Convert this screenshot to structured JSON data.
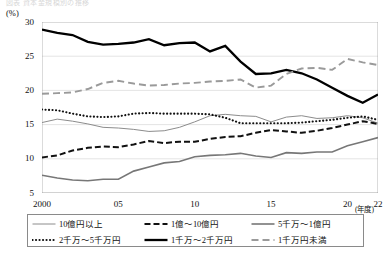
{
  "top_partial_text": "図表 資本金規模別の推移",
  "axis": {
    "unit_label": "(%)",
    "y_ticks": [
      "30",
      "25",
      "20",
      "15",
      "10",
      "5"
    ],
    "y_min": 5,
    "y_max": 30,
    "x_ticks": [
      {
        "label": "2000",
        "year": 2000
      },
      {
        "label": "05",
        "year": 2005
      },
      {
        "label": "10",
        "year": 2010
      },
      {
        "label": "15",
        "year": 2015
      },
      {
        "label": "20",
        "year": 2020
      },
      {
        "label": "22",
        "year": 2022
      }
    ],
    "x_unit_label": "(年度)"
  },
  "legend": {
    "items": [
      {
        "label": "10億円以上",
        "style": "thin-gray-solid",
        "color": "#8c8c8c"
      },
      {
        "label": "1億～10億円",
        "style": "black-dashed",
        "color": "#111111"
      },
      {
        "label": "5千万～1億円",
        "style": "gray-solid",
        "color": "#777777"
      },
      {
        "label": "2千万～5千万円",
        "style": "black-dotted",
        "color": "#111111"
      },
      {
        "label": "1千万～2千万円",
        "style": "thick-black-solid",
        "color": "#000000"
      },
      {
        "label": "1千万円未満",
        "style": "gray-dashed",
        "color": "#9a9a9a"
      }
    ]
  },
  "chart_data": {
    "type": "line",
    "title": "",
    "xlabel": "(年度)",
    "ylabel": "(%)",
    "ylim": [
      5,
      30
    ],
    "xlim": [
      2000,
      2022
    ],
    "grid": true,
    "legend_position": "bottom",
    "x": [
      2000,
      2001,
      2002,
      2003,
      2004,
      2005,
      2006,
      2007,
      2008,
      2009,
      2010,
      2011,
      2012,
      2013,
      2014,
      2015,
      2016,
      2017,
      2018,
      2019,
      2020,
      2021,
      2022
    ],
    "categories": [
      "2000",
      "2001",
      "2002",
      "2003",
      "2004",
      "2005",
      "2006",
      "2007",
      "2008",
      "2009",
      "2010",
      "2011",
      "2012",
      "2013",
      "2014",
      "2015",
      "2016",
      "2017",
      "2018",
      "2019",
      "2020",
      "2021",
      "2022"
    ],
    "series": [
      {
        "name": "10億円以上",
        "style": "thin-gray-solid",
        "color": "#8c8c8c",
        "values": [
          15.3,
          15.8,
          15.5,
          15.1,
          14.6,
          14.5,
          14.3,
          14.0,
          14.1,
          14.6,
          15.4,
          16.3,
          16.5,
          16.3,
          16.2,
          15.4,
          16.1,
          16.3,
          15.9,
          16.0,
          16.3,
          16.0,
          15.2
        ]
      },
      {
        "name": "1億～10億円",
        "style": "black-dashed",
        "color": "#111111",
        "values": [
          10.2,
          10.5,
          11.2,
          11.6,
          11.8,
          11.7,
          12.1,
          12.6,
          12.3,
          12.5,
          12.5,
          12.9,
          13.2,
          13.3,
          13.8,
          14.2,
          14.0,
          13.8,
          14.1,
          14.5,
          15.0,
          15.5,
          15.1
        ]
      },
      {
        "name": "5千万～1億円",
        "style": "gray-solid",
        "color": "#777777",
        "values": [
          7.6,
          7.2,
          6.9,
          6.8,
          7.0,
          7.0,
          8.2,
          8.8,
          9.4,
          9.6,
          10.3,
          10.5,
          10.6,
          10.8,
          10.4,
          10.2,
          10.9,
          10.8,
          11.0,
          11.0,
          11.9,
          12.5,
          13.1
        ]
      },
      {
        "name": "2千万～5千万円",
        "style": "black-dotted",
        "color": "#111111",
        "values": [
          17.2,
          17.1,
          16.6,
          16.2,
          16.1,
          16.2,
          16.6,
          16.7,
          16.6,
          16.6,
          16.6,
          16.5,
          16.0,
          15.2,
          15.2,
          15.2,
          15.2,
          15.3,
          15.5,
          15.7,
          16.0,
          16.2,
          15.7
        ]
      },
      {
        "name": "1千万～2千万円",
        "style": "thick-black-solid",
        "color": "#000000",
        "values": [
          28.9,
          28.4,
          28.1,
          27.1,
          26.7,
          26.8,
          27.0,
          27.5,
          26.6,
          26.9,
          27.0,
          25.7,
          26.5,
          24.2,
          22.4,
          22.5,
          23.0,
          22.5,
          21.6,
          20.4,
          19.2,
          18.2,
          19.4
        ]
      },
      {
        "name": "1千万円未満",
        "style": "gray-dashed",
        "color": "#9a9a9a",
        "values": [
          19.5,
          19.6,
          19.7,
          20.2,
          21.1,
          21.4,
          21.0,
          20.7,
          20.8,
          21.0,
          21.1,
          21.3,
          21.4,
          21.6,
          20.4,
          20.7,
          22.4,
          23.2,
          23.3,
          23.0,
          24.6,
          24.1,
          23.7
        ]
      }
    ]
  }
}
